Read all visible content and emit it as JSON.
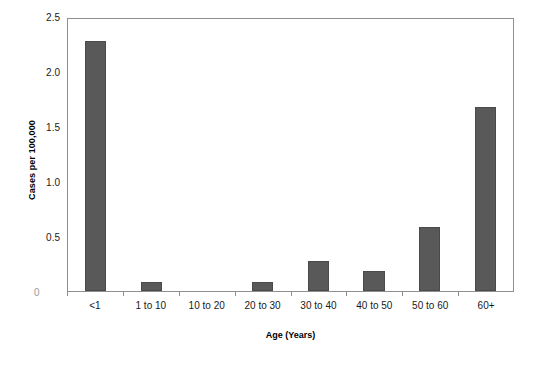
{
  "chart_data": {
    "type": "bar",
    "title": "",
    "xlabel": "Age (Years)",
    "ylabel": "Cases per 100,000",
    "categories": [
      "<1",
      "1 to 10",
      "10 to 20",
      "20 to 30",
      "30 to 40",
      "40 to 50",
      "50 to 60",
      "60+"
    ],
    "values": [
      2.3,
      0.08,
      0,
      0.08,
      0.28,
      0.18,
      0.59,
      1.69
    ],
    "ylim": [
      0,
      2.5
    ],
    "ytick_labels": [
      "2.5",
      "2.0",
      "1.5",
      "1.0",
      "0.5",
      "0"
    ],
    "ytick_values": [
      2.5,
      2.0,
      1.5,
      1.0,
      0.5,
      0
    ],
    "grid": false,
    "legend": false,
    "series_color": "#595959",
    "axis_color": "#8f8f8f"
  }
}
